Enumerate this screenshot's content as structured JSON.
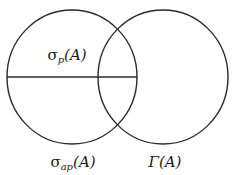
{
  "diagram": {
    "type": "venn",
    "stroke_color": "#2a2a2a",
    "background": "#ffffff",
    "circles": [
      {
        "id": "left",
        "cx": 72,
        "cy": 77,
        "rx": 65,
        "ry": 67
      },
      {
        "id": "right",
        "cx": 163,
        "cy": 77,
        "rx": 65,
        "ry": 67
      }
    ],
    "divider": {
      "x1": 7,
      "y1": 77,
      "x2": 137,
      "y2": 77
    },
    "labels": {
      "sigma_p": {
        "base": "σ",
        "sub": "p",
        "arg": "(A)"
      },
      "sigma_ap": {
        "base": "σ",
        "sub": "ap",
        "arg": "(A)"
      },
      "gamma": {
        "base": "Γ",
        "arg": "(A)"
      }
    }
  }
}
